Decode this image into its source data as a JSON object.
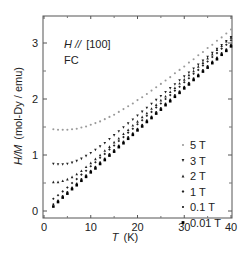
{
  "chart_data": {
    "type": "scatter",
    "title": "",
    "annotations": [
      {
        "text_italic": "H //",
        "text": "[100]"
      },
      {
        "text": "FC"
      }
    ],
    "xlabel": "T  (K)",
    "xlabel_italic": "T",
    "xlabel_unit": "(K)",
    "ylabel": "H/M  (mol-Dy / emu)",
    "ylabel_italic": "H/M",
    "ylabel_unit": "(mol-Dy / emu)",
    "xlim": [
      0,
      40
    ],
    "ylim": [
      0,
      3.5
    ],
    "xticks": [
      0,
      10,
      20,
      30,
      40
    ],
    "yticks": [
      0,
      1,
      2,
      3
    ],
    "grid": false,
    "legend_position": "lower right",
    "x": [
      2,
      3,
      4,
      5,
      6,
      7,
      8,
      9,
      10,
      11,
      12,
      13,
      14,
      15,
      16,
      17,
      18,
      19,
      20,
      21,
      22,
      23,
      24,
      25,
      26,
      27,
      28,
      29,
      30,
      31,
      32,
      33,
      34,
      35,
      36,
      37,
      38,
      39,
      40
    ],
    "series": [
      {
        "name": "5 T",
        "color": "#9a9a9a",
        "marker": "circle",
        "values": [
          1.46,
          1.45,
          1.45,
          1.45,
          1.46,
          1.47,
          1.49,
          1.51,
          1.54,
          1.57,
          1.6,
          1.64,
          1.68,
          1.72,
          1.77,
          1.82,
          1.87,
          1.92,
          1.98,
          2.03,
          2.09,
          2.15,
          2.21,
          2.27,
          2.33,
          2.39,
          2.46,
          2.52,
          2.58,
          2.65,
          2.71,
          2.78,
          2.84,
          2.91,
          2.97,
          3.04,
          3.1,
          3.17,
          3.24
        ]
      },
      {
        "name": "3 T",
        "color": "#222222",
        "marker": "triangle-down",
        "values": [
          0.84,
          0.83,
          0.83,
          0.84,
          0.86,
          0.89,
          0.93,
          0.98,
          1.03,
          1.09,
          1.15,
          1.21,
          1.28,
          1.35,
          1.42,
          1.49,
          1.56,
          1.63,
          1.7,
          1.77,
          1.84,
          1.91,
          1.98,
          2.05,
          2.12,
          2.19,
          2.26,
          2.33,
          2.4,
          2.47,
          2.54,
          2.61,
          2.68,
          2.75,
          2.82,
          2.89,
          2.96,
          3.03,
          3.1
        ]
      },
      {
        "name": "2 T",
        "color": "#222222",
        "marker": "triangle-up",
        "values": [
          0.52,
          0.52,
          0.54,
          0.57,
          0.61,
          0.66,
          0.72,
          0.79,
          0.86,
          0.93,
          1.0,
          1.08,
          1.15,
          1.23,
          1.3,
          1.38,
          1.45,
          1.53,
          1.6,
          1.68,
          1.75,
          1.83,
          1.9,
          1.98,
          2.05,
          2.13,
          2.2,
          2.28,
          2.35,
          2.43,
          2.5,
          2.58,
          2.65,
          2.73,
          2.8,
          2.88,
          2.95,
          3.03,
          3.1
        ]
      },
      {
        "name": "1 T",
        "color": "#222222",
        "marker": "diamond",
        "values": [
          0.22,
          0.28,
          0.35,
          0.42,
          0.5,
          0.57,
          0.65,
          0.72,
          0.8,
          0.87,
          0.95,
          1.02,
          1.1,
          1.17,
          1.25,
          1.32,
          1.4,
          1.47,
          1.55,
          1.62,
          1.7,
          1.77,
          1.85,
          1.92,
          2.0,
          2.07,
          2.15,
          2.22,
          2.3,
          2.37,
          2.45,
          2.52,
          2.6,
          2.67,
          2.75,
          2.82,
          2.9,
          2.97,
          3.05
        ]
      },
      {
        "name": "0.1 T",
        "color": "#111111",
        "marker": "circle",
        "values": [
          0.12,
          0.19,
          0.27,
          0.34,
          0.42,
          0.49,
          0.57,
          0.64,
          0.72,
          0.79,
          0.87,
          0.94,
          1.02,
          1.09,
          1.17,
          1.24,
          1.32,
          1.39,
          1.47,
          1.54,
          1.62,
          1.69,
          1.77,
          1.84,
          1.92,
          1.99,
          2.07,
          2.14,
          2.22,
          2.29,
          2.37,
          2.44,
          2.52,
          2.59,
          2.67,
          2.74,
          2.82,
          2.89,
          2.97
        ]
      },
      {
        "name": "0.01 T",
        "color": "#000000",
        "marker": "square",
        "values": [
          0.08,
          0.16,
          0.24,
          0.31,
          0.39,
          0.46,
          0.54,
          0.61,
          0.69,
          0.76,
          0.84,
          0.91,
          0.99,
          1.06,
          1.14,
          1.21,
          1.29,
          1.36,
          1.44,
          1.51,
          1.59,
          1.66,
          1.74,
          1.81,
          1.89,
          1.96,
          2.04,
          2.11,
          2.19,
          2.26,
          2.34,
          2.41,
          2.49,
          2.56,
          2.64,
          2.71,
          2.79,
          2.86,
          2.94
        ]
      }
    ]
  },
  "layout": {
    "plot_left": 44,
    "plot_right": 231,
    "plot_top": 16,
    "plot_bottom": 218,
    "y_zero_px": 211,
    "px_per_y": 56
  }
}
